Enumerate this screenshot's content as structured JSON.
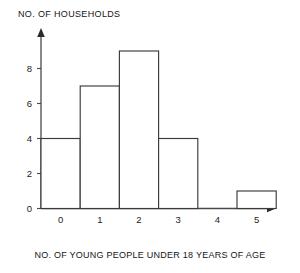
{
  "chart_data": {
    "type": "bar",
    "title": "",
    "subtitle": "",
    "xlabel": "NO. OF YOUNG PEOPLE UNDER 18 YEARS OF AGE",
    "ylabel": "NO. OF HOUSEHOLDS",
    "categories": [
      "0",
      "1",
      "2",
      "3",
      "4",
      "5"
    ],
    "values": [
      4,
      7,
      9,
      4,
      0,
      1
    ],
    "ylim": [
      0,
      10
    ],
    "yticks": [
      "0",
      "2",
      "4",
      "6",
      "8"
    ],
    "ytick_values": [
      0,
      2,
      4,
      6,
      8
    ],
    "grid": false,
    "legend": null,
    "annotations": [],
    "style": {
      "bar_fill": "#ffffff",
      "bar_stroke": "#3b3b3b",
      "axis_color": "#4a4a4a",
      "text_color": "#1a1a1a",
      "background": "#ffffff"
    }
  }
}
